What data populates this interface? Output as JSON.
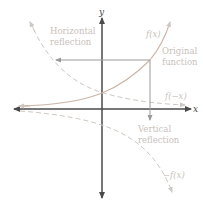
{
  "axes": {
    "x_label": "x",
    "y_label": "y",
    "color": "#4a4a4a"
  },
  "curves": {
    "original": {
      "label": "f(x)",
      "color": "#cbb5a8",
      "style": "solid"
    },
    "horizontal_reflection": {
      "label": "f(−x)",
      "color": "#cfc8c2",
      "style": "dashed"
    },
    "vertical_reflection": {
      "label": "−f(x)",
      "color": "#cfc8c2",
      "style": "dashed"
    }
  },
  "annotations": {
    "horizontal_reflection": [
      "Horizontal",
      "reflection"
    ],
    "original_function": [
      "Original",
      "function"
    ],
    "vertical_reflection": [
      "Vertical",
      "reflection"
    ]
  },
  "arrow_color": "#9a9a9a"
}
